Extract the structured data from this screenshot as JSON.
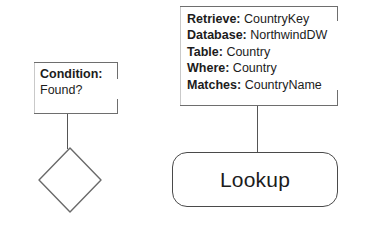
{
  "diagram": {
    "type": "flowchart-fragment",
    "condition_callout": {
      "rows": [
        {
          "key": "Condition:",
          "value": ""
        },
        {
          "key": "",
          "value": "Found?"
        }
      ]
    },
    "lookup_callout": {
      "rows": [
        {
          "key": "Retrieve:",
          "value": "CountryKey"
        },
        {
          "key": "Database:",
          "value": "NorthwindDW"
        },
        {
          "key": "Table:",
          "value": "Country"
        },
        {
          "key": "Where:",
          "value": "Country"
        },
        {
          "key": "Matches:",
          "value": "CountryName"
        }
      ]
    },
    "decision_shape": {
      "label": "",
      "shape": "diamond"
    },
    "lookup_shape": {
      "label": "Lookup",
      "shape": "rounded-rectangle"
    },
    "colors": {
      "stroke": "#6e6e6e",
      "shape_stroke": "#4a4a4a",
      "text": "#1c1c1c",
      "background": "#ffffff"
    }
  }
}
